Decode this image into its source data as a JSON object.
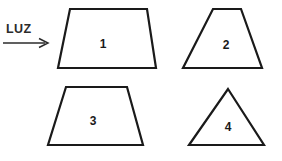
{
  "figure": {
    "background_color": "#ffffff",
    "stroke_color": "#1a1a1a",
    "width": 282,
    "height": 161
  },
  "light_indicator": {
    "label": "LUZ",
    "arrow_direction": "right",
    "arrow_icon_name": "right-arrow-icon",
    "color": "#2b2b2b"
  },
  "shapes": [
    {
      "id": "shape-1",
      "label": "1",
      "kind": "trapezoid",
      "points": "70,9 147,9 156,68 58,68",
      "label_x": 103,
      "label_y": 45
    },
    {
      "id": "shape-2",
      "label": "2",
      "kind": "trapezoid",
      "points": "213,9 241,9 262,68 183,68",
      "label_x": 226,
      "label_y": 46
    },
    {
      "id": "shape-3",
      "label": "3",
      "kind": "trapezoid",
      "points": "66,87 127,87 143,145 48,145",
      "label_x": 93,
      "label_y": 122
    },
    {
      "id": "shape-4",
      "label": "4",
      "kind": "triangle",
      "points": "228,89 264,145 189,145",
      "label_x": 228,
      "label_y": 128
    }
  ]
}
